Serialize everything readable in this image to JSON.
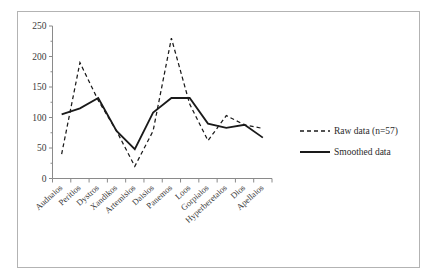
{
  "chart_data": {
    "type": "line",
    "title": "",
    "xlabel": "",
    "ylabel": "",
    "ylim": [
      0,
      250
    ],
    "ytick_values": [
      0,
      50,
      100,
      150,
      200,
      250
    ],
    "ytick_labels": [
      "0",
      "50",
      "100",
      "150",
      "200",
      "250"
    ],
    "grid": false,
    "legend_position": "right",
    "categories": [
      "Audnaios",
      "Peritios",
      "Dystros",
      "Xandikos",
      "Artemisios",
      "Daisios",
      "Panemos",
      "Loos",
      "Gorpiaios",
      "Hyperberetaios",
      "Dios",
      "Apellaios"
    ],
    "series": [
      {
        "name": "Raw data (n=57)",
        "style": "dashed",
        "color": "#1a1a1a",
        "values": [
          40,
          190,
          128,
          78,
          20,
          78,
          230,
          122,
          62,
          103,
          88,
          82
        ]
      },
      {
        "name": "Smoothed data",
        "style": "solid",
        "color": "#1a1a1a",
        "values": [
          105,
          115,
          132,
          78,
          48,
          108,
          132,
          132,
          90,
          83,
          88,
          67
        ]
      }
    ]
  },
  "legend": {
    "entries": [
      {
        "label": "Raw data (n=57)",
        "icon": "dashed-line-icon"
      },
      {
        "label": "Smoothed data",
        "icon": "solid-line-icon"
      }
    ]
  },
  "axes": {
    "y_axis_name": "value-axis",
    "x_axis_name": "category-axis"
  }
}
